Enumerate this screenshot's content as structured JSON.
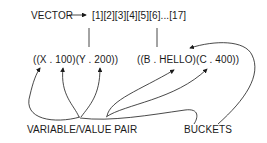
{
  "diagram": {
    "vector_label": "VECTOR",
    "vector_slots": "[1][2][3][4][5][6]...[17]",
    "bucket_1": "((X . 100)(Y . 200))",
    "bucket_2": "((B . HELLO)(C . 400))",
    "label_pair": "VARIABLE/VALUE PAIR",
    "label_buckets": "BUCKETS",
    "colors": {
      "ink": "#1a1a1a",
      "background": "#ffffff"
    }
  }
}
